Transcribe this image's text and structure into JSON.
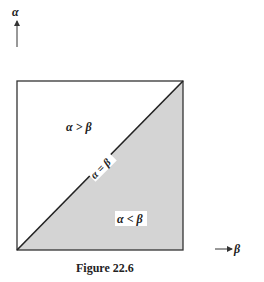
{
  "diagram": {
    "y_axis_label": "α",
    "x_axis_label": "β",
    "region_upper_label": "α > β",
    "region_lower_label": "α < β",
    "diagonal_label": "α = β",
    "caption": "Figure 22.6",
    "colors": {
      "line": "#222222",
      "shaded_region": "#d4d4d4",
      "background": "#ffffff"
    }
  }
}
